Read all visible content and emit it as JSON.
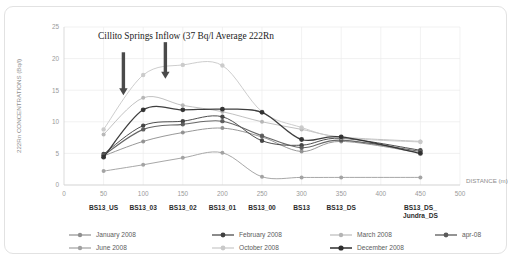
{
  "chart_data": {
    "type": "line",
    "title": "",
    "annotation": "Cillito Springs Inflow (37 Bq/l Average 222Rn",
    "xlabel": "DISTANCE (m)",
    "ylabel": "222Rn CONCENTRATIONS (Bq/l)",
    "xlim": [
      0,
      500
    ],
    "ylim": [
      0,
      25
    ],
    "xticks": [
      0,
      50,
      100,
      150,
      200,
      250,
      300,
      350,
      400,
      450,
      500
    ],
    "yticks": [
      0,
      5,
      10,
      15,
      20,
      25
    ],
    "grid": true,
    "legend_position": "bottom",
    "x": [
      50,
      100,
      150,
      200,
      250,
      300,
      350,
      450
    ],
    "category_labels": [
      {
        "x": 50,
        "label": "BS13_US"
      },
      {
        "x": 100,
        "label": "BS13_03"
      },
      {
        "x": 150,
        "label": "BS13_02"
      },
      {
        "x": 200,
        "label": "BS13_01"
      },
      {
        "x": 250,
        "label": "BS13_00"
      },
      {
        "x": 300,
        "label": "BS13"
      },
      {
        "x": 350,
        "label": "BS13_DS"
      },
      {
        "x": 450,
        "label": "BS13_DS_\nJundra_DS"
      }
    ],
    "series": [
      {
        "name": "January 2008",
        "color": "#8f8f8f",
        "width": 1.0,
        "marker": 2.0,
        "values": [
          4.6,
          6.9,
          8.3,
          9.0,
          7.6,
          5.3,
          6.9,
          5.1
        ]
      },
      {
        "name": "February 2008",
        "color": "#3f3f3f",
        "width": 1.0,
        "marker": 2.2,
        "values": [
          4.9,
          9.4,
          10.1,
          10.8,
          7.0,
          6.3,
          7.4,
          5.5
        ]
      },
      {
        "name": "March 2008",
        "color": "#b4b4b4",
        "width": 0.9,
        "marker": 2.0,
        "values": [
          8.0,
          13.8,
          12.6,
          11.6,
          10.0,
          8.8,
          7.6,
          6.9
        ]
      },
      {
        "name": "apr-08",
        "color": "#5a5a5a",
        "width": 1.1,
        "marker": 2.2,
        "values": [
          4.7,
          8.8,
          9.6,
          10.1,
          7.8,
          5.9,
          7.1,
          5.3
        ]
      },
      {
        "name": "June 2008",
        "color": "#a0a0a0",
        "width": 1.0,
        "marker": 2.0,
        "values": [
          2.2,
          3.2,
          4.3,
          5.1,
          1.3,
          1.2,
          1.2,
          1.2
        ]
      },
      {
        "name": "October 2008",
        "color": "#c9c9c9",
        "width": 1.0,
        "marker": 2.2,
        "values": [
          8.8,
          17.4,
          19.0,
          18.9,
          11.6,
          9.1,
          7.5,
          6.8
        ]
      },
      {
        "name": "December 2008",
        "color": "#2e2e2e",
        "width": 1.3,
        "marker": 2.4,
        "values": [
          4.4,
          11.9,
          11.9,
          12.0,
          11.5,
          7.2,
          7.6,
          5.0
        ]
      }
    ],
    "arrows": [
      {
        "x": 75,
        "y_top": 21.0,
        "y_bottom": 14.2
      },
      {
        "x": 128,
        "y_top": 22.6,
        "y_bottom": 16.8
      }
    ]
  }
}
